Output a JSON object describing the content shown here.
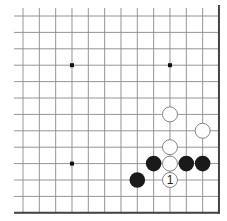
{
  "diagram": {
    "type": "go-board-fragment",
    "grid": {
      "cols": 13,
      "rows": 13,
      "origin_x": 23,
      "origin_y": 16,
      "spacing_x": 16.33,
      "spacing_y": 16.4,
      "edges": [
        "right",
        "bottom"
      ]
    },
    "colors": {
      "line": "#8a8a8a",
      "edge": "#444444",
      "black_stone": "#1a1a1a",
      "white_stone": "#ffffff",
      "white_stroke": "#777777",
      "star": "#111111"
    },
    "star_points": [
      {
        "col": 3,
        "row": 3
      },
      {
        "col": 9,
        "row": 3
      },
      {
        "col": 3,
        "row": 9
      }
    ],
    "stones": [
      {
        "color": "white",
        "col": 9,
        "row": 6,
        "label": ""
      },
      {
        "color": "white",
        "col": 11,
        "row": 7,
        "label": ""
      },
      {
        "color": "white",
        "col": 9,
        "row": 8,
        "label": ""
      },
      {
        "color": "black",
        "col": 8,
        "row": 9,
        "label": ""
      },
      {
        "color": "white",
        "col": 9,
        "row": 9,
        "label": ""
      },
      {
        "color": "black",
        "col": 10,
        "row": 9,
        "label": ""
      },
      {
        "color": "black",
        "col": 11,
        "row": 9,
        "label": ""
      },
      {
        "color": "black",
        "col": 7,
        "row": 10,
        "label": ""
      },
      {
        "color": "white",
        "col": 9,
        "row": 10,
        "label": "1"
      }
    ]
  }
}
